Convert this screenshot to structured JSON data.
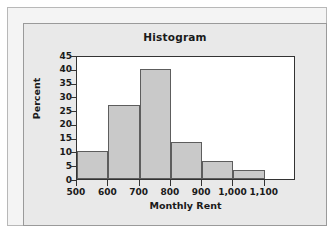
{
  "chart_data": {
    "type": "bar",
    "title": "Histogram",
    "xlabel": "Monthly Rent",
    "ylabel": "Percent",
    "grid": false,
    "legend": "none",
    "bin_width": 100,
    "xlim": [
      500,
      1200
    ],
    "ylim": [
      0,
      45
    ],
    "x_ticks": [
      500,
      600,
      700,
      800,
      900,
      1000,
      1100
    ],
    "x_tick_labels": [
      "500",
      "600",
      "700",
      "800",
      "900",
      "1,000",
      "1,100"
    ],
    "y_ticks": [
      0,
      5,
      10,
      15,
      20,
      25,
      30,
      35,
      40,
      45
    ],
    "y_tick_labels": [
      "0",
      "5",
      "10",
      "15",
      "20",
      "25",
      "30",
      "35",
      "40",
      "45"
    ],
    "categories": [
      "500-600",
      "600-700",
      "700-800",
      "800-900",
      "900-1,000",
      "1,000-1,100"
    ],
    "bin_edges": [
      500,
      600,
      700,
      800,
      900,
      1000,
      1100
    ],
    "values": [
      10,
      26.7,
      40,
      13.3,
      6.7,
      3.3
    ],
    "bars": [
      {
        "label": "500-600",
        "start": 500,
        "end": 600,
        "value": 10
      },
      {
        "label": "600-700",
        "start": 600,
        "end": 700,
        "value": 26.7
      },
      {
        "label": "700-800",
        "start": 700,
        "end": 800,
        "value": 40
      },
      {
        "label": "800-900",
        "start": 800,
        "end": 900,
        "value": 13.3
      },
      {
        "label": "900-1,000",
        "start": 900,
        "end": 1000,
        "value": 6.7
      },
      {
        "label": "1,000-1,100",
        "start": 1000,
        "end": 1100,
        "value": 3.3
      }
    ],
    "colors": {
      "bar_fill": "#c9c9c9",
      "bar_edge": "#5d5d5d",
      "plot_background": "#ffffff",
      "figure_background": "#e9e9e9",
      "outer_background": "#f4f4f4",
      "axis": "#333333",
      "text": "#1a1a1a"
    }
  }
}
